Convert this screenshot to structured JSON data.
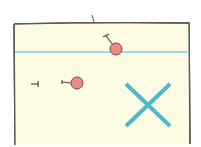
{
  "diagram": {
    "style": "hand-drawn sketch",
    "colors": {
      "background": "#ffffff",
      "box_fill": "#fdfbe4",
      "box_border": "#5a5a5a",
      "line": "#7fd0e6",
      "pin_fill": "#f08a8a",
      "pin_stroke": "#7a4a3a",
      "x_mark": "#4fb8c8"
    },
    "box": {
      "x": 14,
      "y": 23,
      "width": 176,
      "height": 122
    },
    "horizontal_line": {
      "y": 52
    },
    "pins": [
      {
        "id": "pin-upper",
        "cx": 116,
        "cy": 49,
        "r": 6
      },
      {
        "id": "pin-lower",
        "cx": 77,
        "cy": 83,
        "r": 6
      }
    ],
    "small_mark": {
      "x": 35,
      "y": 84
    },
    "x_mark": {
      "cx": 147,
      "cy": 103,
      "size": 22
    }
  }
}
